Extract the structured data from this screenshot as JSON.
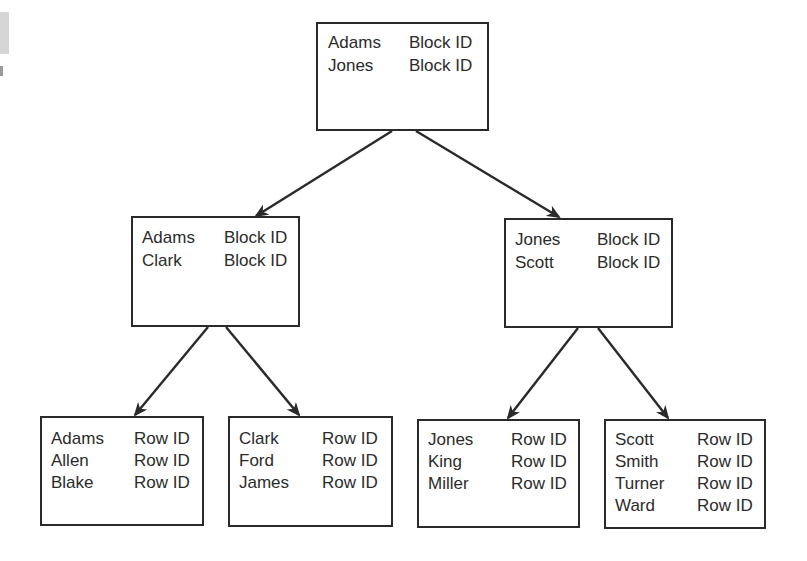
{
  "diagram": {
    "title": "",
    "type": "b-tree-index",
    "colors": {
      "line": "#2a2a2a",
      "text": "#2b2b2b",
      "background": "#ffffff"
    },
    "nodes": {
      "root": {
        "level": "root",
        "entries": [
          {
            "key": "Adams",
            "pointer": "Block ID"
          },
          {
            "key": "Jones",
            "pointer": "Block ID"
          }
        ]
      },
      "branch_left": {
        "level": "branch",
        "entries": [
          {
            "key": "Adams",
            "pointer": "Block ID"
          },
          {
            "key": "Clark",
            "pointer": "Block ID"
          }
        ]
      },
      "branch_right": {
        "level": "branch",
        "entries": [
          {
            "key": "Jones",
            "pointer": "Block ID"
          },
          {
            "key": "Scott",
            "pointer": "Block ID"
          }
        ]
      },
      "leaf_1": {
        "level": "leaf",
        "entries": [
          {
            "key": "Adams",
            "pointer": "Row ID"
          },
          {
            "key": "Allen",
            "pointer": "Row ID"
          },
          {
            "key": "Blake",
            "pointer": "Row ID"
          }
        ]
      },
      "leaf_2": {
        "level": "leaf",
        "entries": [
          {
            "key": "Clark",
            "pointer": "Row ID"
          },
          {
            "key": "Ford",
            "pointer": "Row ID"
          },
          {
            "key": "James",
            "pointer": "Row ID"
          }
        ]
      },
      "leaf_3": {
        "level": "leaf",
        "entries": [
          {
            "key": "Jones",
            "pointer": "Row ID"
          },
          {
            "key": "King",
            "pointer": "Row ID"
          },
          {
            "key": "Miller",
            "pointer": "Row ID"
          }
        ]
      },
      "leaf_4": {
        "level": "leaf",
        "entries": [
          {
            "key": "Scott",
            "pointer": "Row ID"
          },
          {
            "key": "Smith",
            "pointer": "Row ID"
          },
          {
            "key": "Turner",
            "pointer": "Row ID"
          },
          {
            "key": "Ward",
            "pointer": "Row ID"
          }
        ]
      }
    },
    "edges": [
      {
        "from": "root",
        "to": "branch_left"
      },
      {
        "from": "root",
        "to": "branch_right"
      },
      {
        "from": "branch_left",
        "to": "leaf_1"
      },
      {
        "from": "branch_left",
        "to": "leaf_2"
      },
      {
        "from": "branch_right",
        "to": "leaf_3"
      },
      {
        "from": "branch_right",
        "to": "leaf_4"
      }
    ]
  }
}
